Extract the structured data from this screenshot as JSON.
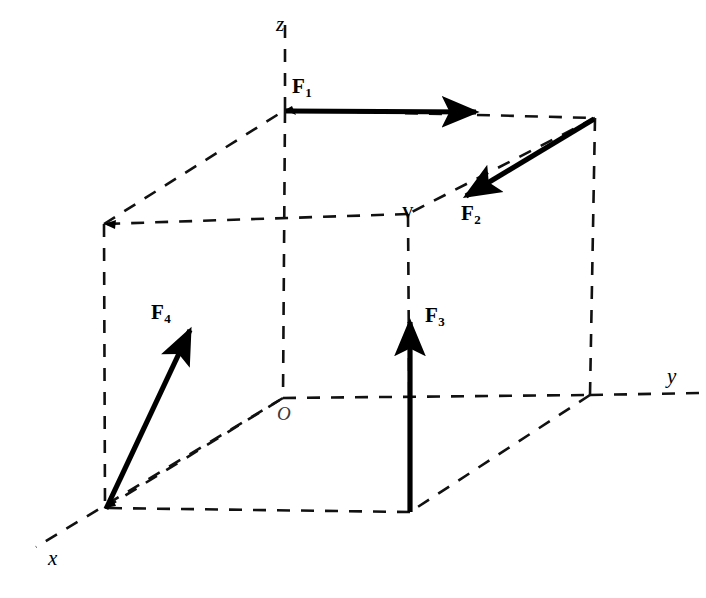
{
  "figure": {
    "type": "3d-vector-diagram",
    "background_color": "#ffffff",
    "line_color": "#111111",
    "vector_color": "#000000"
  },
  "axes": {
    "x": {
      "label": "x",
      "tip": [
        35,
        548
      ],
      "origin": [
        283,
        398
      ]
    },
    "y": {
      "label": "y",
      "tip": [
        700,
        393
      ],
      "origin": [
        590,
        395
      ]
    },
    "z": {
      "label": "z",
      "tip": [
        285,
        15
      ],
      "origin": [
        285,
        110
      ]
    },
    "origin": {
      "label": "O",
      "position": [
        283,
        398
      ]
    }
  },
  "vertices": {
    "top_back_left": [
      104,
      224
    ],
    "top_back_right": [
      285,
      110
    ],
    "top_front_right": [
      595,
      118
    ],
    "top_front_left": [
      408,
      214
    ],
    "bottom_back_left": [
      105,
      508
    ],
    "bottom_back_right": [
      283,
      398
    ],
    "bottom_front_right": [
      590,
      395
    ],
    "bottom_front_left": [
      410,
      512
    ],
    "labeled_vertex": {
      "label": "V",
      "position": [
        408,
        214
      ]
    }
  },
  "forces": [
    {
      "name": "F1",
      "label": "F",
      "subscript": "1",
      "from": [
        285,
        110
      ],
      "to": [
        487,
        112
      ],
      "direction": "+y",
      "label_position": [
        294,
        84
      ]
    },
    {
      "name": "F2",
      "label": "F",
      "subscript": "2",
      "from": [
        594,
        119
      ],
      "to": [
        457,
        201
      ],
      "direction": "toward-V",
      "label_position": [
        462,
        205
      ]
    },
    {
      "name": "F3",
      "label": "F",
      "subscript": "3",
      "from": [
        410,
        512
      ],
      "to": [
        410,
        311
      ],
      "direction": "+z",
      "label_position": [
        425,
        310
      ]
    },
    {
      "name": "F4",
      "label": "F",
      "subscript": "4",
      "from": [
        106,
        509
      ],
      "to": [
        196,
        317
      ],
      "direction": "up-right-diagonal",
      "label_position": [
        152,
        305
      ]
    }
  ]
}
